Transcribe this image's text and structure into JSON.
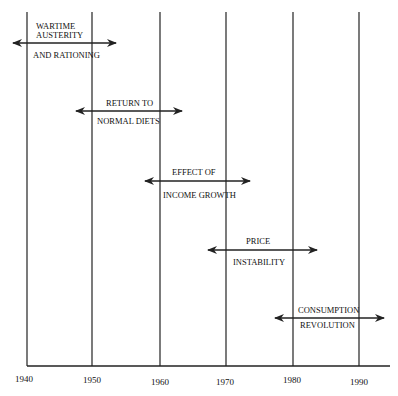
{
  "timeline": {
    "axis_labels": [
      "1940",
      "1950",
      "1960",
      "1970",
      "1980",
      "1990"
    ],
    "periods": [
      {
        "line1": "WARTIME",
        "line1b": "AUSTERITY",
        "line2": "AND RATIONING",
        "start": 1938,
        "end": 1953
      },
      {
        "line1": "RETURN TO",
        "line2": "NORMAL DIETS",
        "start": 1947,
        "end": 1963
      },
      {
        "line1": "EFFECT OF",
        "line2": "INCOME GROWTH",
        "start": 1958,
        "end": 1974
      },
      {
        "line1": "PRICE",
        "line2": "INSTABILITY",
        "start": 1968,
        "end": 1984
      },
      {
        "line1": "CONSUMPTION",
        "line2": "REVOLUTION",
        "start": 1977,
        "end": 1995
      }
    ]
  },
  "colors": {
    "line": "#222222",
    "text": "#111111",
    "background": "#ffffff"
  }
}
